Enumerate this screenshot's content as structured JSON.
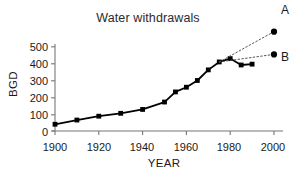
{
  "chart_data": {
    "type": "line",
    "title": "Water withdrawals",
    "xlabel": "YEAR",
    "ylabel": "BGD",
    "xlim": [
      1900,
      2000
    ],
    "ylim": [
      0,
      500
    ],
    "xticks": [
      1900,
      1920,
      1940,
      1960,
      1980,
      2000
    ],
    "yticks": [
      0,
      100,
      200,
      300,
      400,
      500
    ],
    "grid": false,
    "legend": "none",
    "series": [
      {
        "name": "historical",
        "style": "solid",
        "marker": "square",
        "x": [
          1900,
          1910,
          1920,
          1930,
          1940,
          1950,
          1955,
          1960,
          1965,
          1970,
          1975,
          1980,
          1985,
          1990
        ],
        "values": [
          40,
          65,
          88,
          105,
          128,
          172,
          232,
          260,
          300,
          363,
          410,
          430,
          392,
          397
        ]
      },
      {
        "name": "A",
        "style": "dotted",
        "marker": "circle",
        "x": [
          1975,
          2000
        ],
        "values": [
          410,
          590
        ]
      },
      {
        "name": "B",
        "style": "dotted",
        "marker": "circle",
        "x": [
          1975,
          2000
        ],
        "values": [
          410,
          455
        ]
      }
    ],
    "annotations": [
      {
        "id": "label-a",
        "text": "A",
        "x": 2000,
        "y": 590
      },
      {
        "id": "label-b",
        "text": "B",
        "x": 2000,
        "y": 455
      }
    ]
  },
  "axes": {
    "ylabel": "BGD",
    "xlabel": "YEAR",
    "ytick_labels": [
      "500",
      "400",
      "300",
      "200",
      "100",
      "0"
    ],
    "xtick_labels": [
      "1900",
      "1920",
      "1940",
      "1960",
      "1980",
      "2000"
    ]
  },
  "labels": {
    "title": "Water withdrawals",
    "series_a": "A",
    "series_b": "B"
  },
  "colors": {
    "line": "#000000",
    "marker": "#000000",
    "projection": "#555555",
    "axis": "#777777",
    "text": "#1a1a1a"
  }
}
